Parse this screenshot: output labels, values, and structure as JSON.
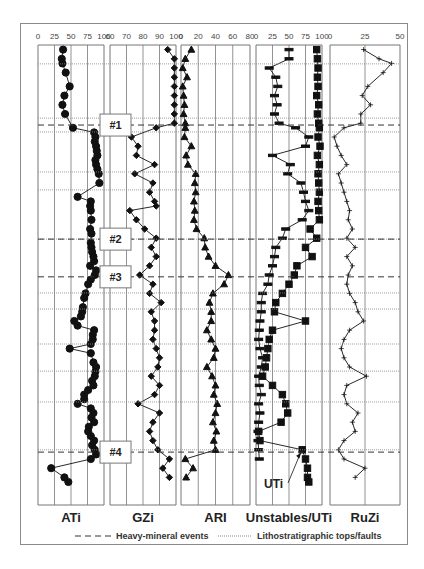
{
  "chart_data": {
    "type": "line",
    "title": "",
    "layout": {
      "panels": 5,
      "orientation": "vertical-profile (y = depth/stratigraphic position, top to bottom)",
      "grid": true,
      "legend_position": "bottom"
    },
    "y_axis": {
      "label": "",
      "note": "relative stratigraphic position 0 (top) to 100 (base), unlabeled"
    },
    "events": [
      {
        "label": "#1",
        "y": 17.4
      },
      {
        "label": "#2",
        "y": 42.2
      },
      {
        "label": "#3",
        "y": 50.4
      },
      {
        "label": "#4",
        "y": 88.5
      }
    ],
    "litho_tops_y": [
      4.1,
      15.9,
      18.9,
      27.6,
      31.5,
      42.2,
      53.9,
      57.4,
      65.0,
      70.9,
      77.6,
      88.0
    ],
    "panels": [
      {
        "name": "ATi",
        "xlim": [
          0,
          100
        ],
        "xticks": [
          "0",
          "25",
          "50",
          "75",
          "100"
        ],
        "marker": "circle",
        "series": [
          {
            "name": "ATi",
            "y": [
              1,
              3,
              4,
              6,
              9,
              11,
              13,
              15,
              18,
              19,
              20,
              21,
              22,
              23,
              24,
              25,
              26,
              27,
              28,
              30,
              33,
              34,
              35,
              36,
              38,
              40,
              41,
              43,
              44,
              45,
              46,
              47,
              48,
              49,
              50,
              51,
              52,
              54,
              55,
              57,
              58,
              59,
              60,
              61,
              62,
              63,
              64,
              65,
              66,
              67,
              69,
              70,
              71,
              72,
              73,
              74,
              75,
              76,
              77,
              78,
              79,
              80,
              81,
              82,
              83,
              84,
              85,
              86,
              87,
              88,
              89,
              90,
              92,
              94,
              95
            ],
            "x": [
              38,
              36,
              37,
              42,
              48,
              40,
              37,
              41,
              53,
              85,
              87,
              86,
              88,
              89,
              90,
              87,
              88,
              90,
              92,
              93,
              60,
              80,
              79,
              80,
              81,
              79,
              81,
              80,
              81,
              82,
              84,
              85,
              79,
              88,
              86,
              80,
              76,
              72,
              70,
              68,
              67,
              65,
              55,
              60,
              85,
              83,
              83,
              80,
              48,
              80,
              84,
              88,
              87,
              86,
              82,
              84,
              76,
              70,
              70,
              60,
              80,
              84,
              81,
              85,
              77,
              76,
              80,
              85,
              82,
              86,
              88,
              80,
              20,
              40,
              46
            ]
          }
        ]
      },
      {
        "name": "GZi",
        "xlim": [
          60,
          100
        ],
        "xticks": [
          "60",
          "70",
          "80",
          "90",
          "100"
        ],
        "marker": "diamond",
        "series": [
          {
            "name": "GZi",
            "y": [
              1,
              3,
              5,
              7,
              9,
              11,
              13,
              15,
              17,
              18,
              20,
              22,
              24,
              26,
              28,
              30,
              32,
              34,
              35,
              36,
              38,
              40,
              42,
              44,
              46,
              48,
              50,
              52,
              54,
              56,
              58,
              60,
              62,
              64,
              66,
              68,
              70,
              72,
              74,
              76,
              78,
              80,
              82,
              84,
              86,
              88,
              90,
              92,
              94
            ],
            "x": [
              95,
              99,
              99,
              99,
              99,
              99,
              99,
              99,
              99,
              88,
              73,
              77,
              76,
              87,
              75,
              86,
              84,
              87,
              88,
              72,
              76,
              81,
              88,
              85,
              88,
              84,
              78,
              86,
              84,
              91,
              85,
              87,
              87,
              86,
              88,
              90,
              89,
              85,
              90,
              87,
              77,
              90,
              86,
              84,
              86,
              89,
              96,
              92,
              96
            ]
          }
        ]
      },
      {
        "name": "ARI",
        "xlim": [
          0,
          80
        ],
        "xticks": [
          "0",
          "20",
          "40",
          "60",
          "80"
        ],
        "marker": "triangle",
        "series": [
          {
            "name": "ARI",
            "y": [
              1,
              3,
              5,
              7,
              9,
              11,
              13,
              15,
              17,
              18,
              20,
              22,
              24,
              26,
              28,
              30,
              32,
              34,
              36,
              38,
              40,
              42,
              44,
              46,
              48,
              50,
              52,
              54,
              56,
              58,
              60,
              62,
              64,
              66,
              68,
              70,
              72,
              74,
              76,
              78,
              80,
              82,
              84,
              86,
              88,
              90,
              92,
              94
            ],
            "x": [
              12,
              5,
              2,
              7,
              2,
              3,
              4,
              3,
              5,
              5,
              4,
              12,
              6,
              8,
              17,
              16,
              17,
              15,
              16,
              15,
              18,
              27,
              28,
              32,
              40,
              55,
              50,
              37,
              33,
              35,
              35,
              30,
              35,
              40,
              38,
              30,
              36,
              40,
              38,
              42,
              40,
              37,
              41,
              38,
              40,
              5,
              14,
              6
            ]
          }
        ]
      },
      {
        "name": "Unstables/UTi",
        "xlim": [
          0,
          100
        ],
        "xticks": [
          "0",
          "25",
          "50",
          "75",
          "100"
        ],
        "series": [
          {
            "name": "Unstables",
            "marker": "dash",
            "y": [
              1,
              3,
              5,
              7,
              9,
              11,
              13,
              15,
              17,
              18,
              20,
              22,
              24,
              26,
              28,
              30,
              32,
              34,
              36,
              38,
              40,
              42,
              44,
              46,
              48,
              50,
              52,
              54,
              56,
              58,
              60,
              62,
              64,
              66,
              68,
              70,
              72,
              74,
              76,
              78,
              80,
              82,
              84,
              86,
              88,
              90
            ],
            "x": [
              50,
              50,
              20,
              30,
              33,
              28,
              32,
              28,
              35,
              60,
              80,
              75,
              25,
              52,
              48,
              68,
              72,
              75,
              80,
              70,
              45,
              40,
              30,
              28,
              25,
              20,
              18,
              10,
              8,
              8,
              6,
              5,
              4,
              6,
              10,
              8,
              4,
              5,
              8,
              4,
              6,
              4,
              3,
              3,
              4,
              5
            ]
          },
          {
            "name": "UTi",
            "marker": "square",
            "annotation": "UTi",
            "y": [
              1,
              3,
              5,
              7,
              9,
              11,
              13,
              15,
              17,
              18,
              20,
              22,
              24,
              26,
              28,
              30,
              32,
              34,
              36,
              38,
              40,
              42,
              44,
              46,
              48,
              50,
              52,
              54,
              56,
              58,
              60,
              62,
              64,
              66,
              68,
              70,
              72,
              74,
              76,
              78,
              80,
              82,
              84,
              86,
              88,
              90,
              92,
              94,
              95
            ],
            "x": [
              92,
              93,
              94,
              93,
              94,
              92,
              95,
              93,
              95,
              96,
              94,
              97,
              93,
              96,
              94,
              95,
              96,
              94,
              95,
              96,
              82,
              92,
              75,
              85,
              62,
              58,
              50,
              40,
              30,
              28,
              75,
              25,
              20,
              18,
              16,
              14,
              10,
              25,
              40,
              45,
              48,
              38,
              4,
              6,
              70,
              75,
              78,
              78,
              80
            ]
          }
        ]
      },
      {
        "name": "RuZi",
        "xlim": [
          0,
          50
        ],
        "xticks": [
          "0",
          "25",
          "50"
        ],
        "marker": "plus",
        "series": [
          {
            "name": "RuZi",
            "y": [
              1,
              3,
              4,
              6,
              9,
              11,
              13,
              15,
              17,
              18,
              20,
              22,
              24,
              26,
              28,
              30,
              32,
              34,
              36,
              38,
              40,
              42,
              44,
              46,
              48,
              50,
              52,
              54,
              56,
              58,
              60,
              62,
              64,
              66,
              68,
              70,
              72,
              74,
              76,
              78,
              80,
              82,
              84,
              86,
              88,
              90,
              92,
              94
            ],
            "x": [
              24,
              35,
              44,
              38,
              27,
              23,
              29,
              22,
              22,
              10,
              3,
              5,
              8,
              12,
              6,
              8,
              10,
              12,
              14,
              13,
              16,
              12,
              18,
              12,
              16,
              13,
              12,
              14,
              18,
              20,
              24,
              14,
              10,
              8,
              10,
              14,
              26,
              12,
              10,
              12,
              20,
              16,
              18,
              10,
              6,
              10,
              25,
              18
            ]
          }
        ]
      }
    ],
    "legend": [
      {
        "style": "dashed",
        "label": "Heavy-mineral events"
      },
      {
        "style": "dotted",
        "label": "Lithostratigraphic tops/faults"
      }
    ]
  }
}
